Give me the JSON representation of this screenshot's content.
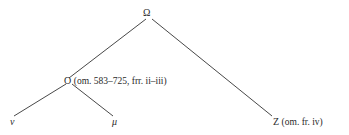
{
  "stemma": {
    "root": {
      "label": "Ω"
    },
    "o_node": {
      "siglum": "O",
      "note": "(om. 583–725, frr. ii–iii)"
    },
    "z_node": {
      "siglum": "Z",
      "note": "(om. fr. iv)"
    },
    "nu_node": {
      "label": "ν"
    },
    "mu_node": {
      "label": "μ"
    }
  },
  "colors": {
    "line": "#333333",
    "text": "#2a2a2a"
  }
}
